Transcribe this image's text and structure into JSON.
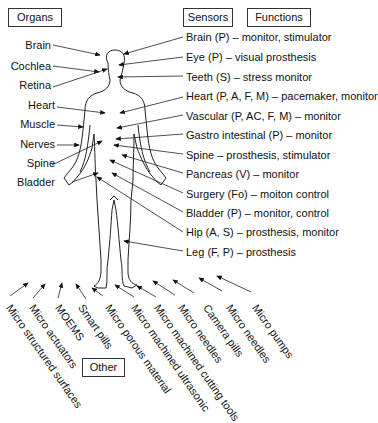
{
  "headers": {
    "organs": "Organs",
    "sensors": "Sensors",
    "functions": "Functions",
    "other": "Other"
  },
  "organs": [
    "Brain",
    "Cochlea",
    "Retina",
    "Heart",
    "Muscle",
    "Nerves",
    "Spine",
    "Bladder"
  ],
  "functions": [
    "Brain (P) – monitor, stimulator",
    "Eye (P) – visual prosthesis",
    "Teeth (S) – stress monitor",
    "Heart (P, A, F, M) – pacemaker, monitor",
    "Vascular (P, AC, F, M) – monitor",
    "Gastro intestinal (P) – monitor",
    "Spine – prosthesis, stimulator",
    "Pancreas (V) – monitor",
    "Surgery (Fo) – moiton control",
    "Bladder (P) – monitor, control",
    "Hip (A, S) – prosthesis, monitor",
    "Leg (F, P) – prosthesis"
  ],
  "other": [
    "Micro structured surfaces",
    "Micro actuators",
    "MOEMS",
    "Smart pills",
    "Micro porous material",
    "Micro machined ultrasonic",
    "Micro machined cutting tools",
    "Micro needles",
    "Camera pills",
    "Micro needles",
    "Micro pumps"
  ]
}
